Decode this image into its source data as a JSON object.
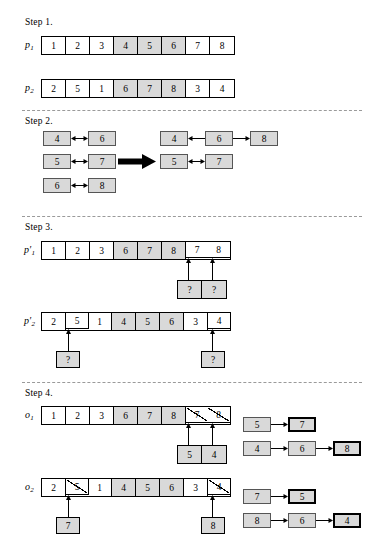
{
  "figure": {
    "steps": [
      {
        "label": "Step 1."
      },
      {
        "label": "Step 2."
      },
      {
        "label": "Step 3."
      },
      {
        "label": "Step 4."
      }
    ]
  },
  "colors": {
    "shade": "#d9d9d9",
    "line": "#000000",
    "separator": "#9a9a9a"
  },
  "step1": {
    "rows": [
      {
        "name": "p",
        "sub": "1",
        "prime": "",
        "cells": [
          "1",
          "2",
          "3",
          "4",
          "5",
          "6",
          "7",
          "8"
        ],
        "shaded": [
          3,
          4,
          5
        ]
      },
      {
        "name": "p",
        "sub": "2",
        "prime": "",
        "cells": [
          "2",
          "5",
          "1",
          "6",
          "7",
          "8",
          "3",
          "4"
        ],
        "shaded": [
          3,
          4,
          5
        ]
      }
    ]
  },
  "step2": {
    "left_pairs": [
      {
        "from": "4",
        "to": "6",
        "arrow": "double"
      },
      {
        "from": "5",
        "to": "7",
        "arrow": "double"
      },
      {
        "from": "6",
        "to": "8",
        "arrow": "double"
      }
    ],
    "transform_arrow": "thick-right-arrow",
    "right_chains": [
      {
        "nodes": [
          "4",
          "6",
          "8"
        ],
        "arrows": [
          "left",
          "right"
        ]
      },
      {
        "nodes": [
          "5",
          "7"
        ],
        "arrows": [
          "double"
        ]
      }
    ]
  },
  "step3": {
    "rows": [
      {
        "name": "p",
        "sub": "1",
        "prime": "′",
        "cells": [
          "1",
          "2",
          "3",
          "6",
          "7",
          "8",
          "7",
          "8"
        ],
        "shaded": [
          3,
          4,
          5
        ],
        "bold": [
          6,
          7
        ],
        "below": [
          {
            "index": 6,
            "text": "?"
          },
          {
            "index": 7,
            "text": "?"
          }
        ]
      },
      {
        "name": "p",
        "sub": "2",
        "prime": "′",
        "cells": [
          "2",
          "5",
          "1",
          "4",
          "5",
          "6",
          "3",
          "4"
        ],
        "shaded": [
          3,
          4,
          5
        ],
        "bold": [
          1,
          7
        ],
        "below": [
          {
            "index": 1,
            "text": "?"
          },
          {
            "index": 7,
            "text": "?"
          }
        ]
      }
    ]
  },
  "step4": {
    "rows": [
      {
        "name": "o",
        "sub": "1",
        "prime": "",
        "cells": [
          "1",
          "2",
          "3",
          "6",
          "7",
          "8",
          "7",
          "8"
        ],
        "shaded": [
          3,
          4,
          5
        ],
        "struck": [
          6,
          7
        ],
        "below": [
          {
            "index": 6,
            "text": "5"
          },
          {
            "index": 7,
            "text": "4"
          }
        ],
        "chains": [
          {
            "nodes": [
              "5",
              "7"
            ],
            "bold_last": true
          },
          {
            "nodes": [
              "4",
              "6",
              "8"
            ],
            "bold_last": true
          }
        ]
      },
      {
        "name": "o",
        "sub": "2",
        "prime": "",
        "cells": [
          "2",
          "5",
          "1",
          "4",
          "5",
          "6",
          "3",
          "4"
        ],
        "shaded": [
          3,
          4,
          5
        ],
        "struck": [
          1,
          7
        ],
        "below": [
          {
            "index": 1,
            "text": "7"
          },
          {
            "index": 7,
            "text": "8"
          }
        ],
        "chains": [
          {
            "nodes": [
              "7",
              "5"
            ],
            "bold_last": true
          },
          {
            "nodes": [
              "8",
              "6",
              "4"
            ],
            "bold_last": true
          }
        ]
      }
    ]
  }
}
